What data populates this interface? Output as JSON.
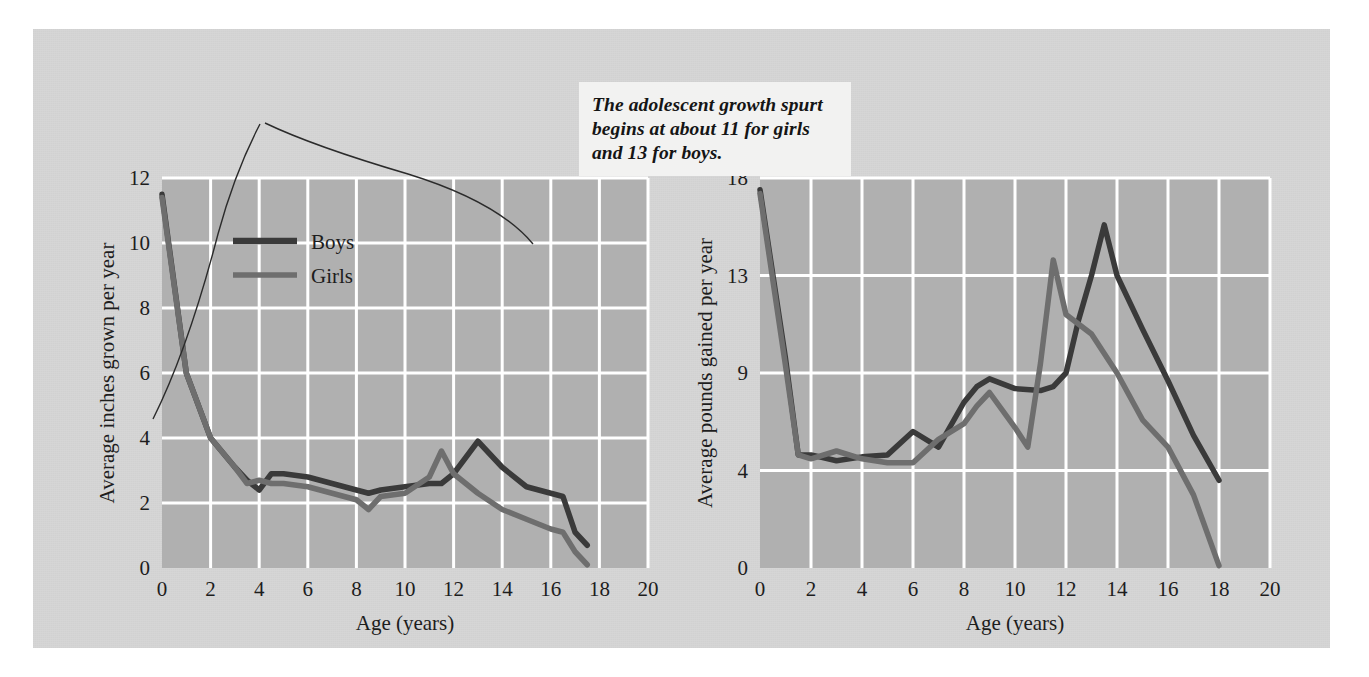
{
  "figure": {
    "background_color": "#d6d6d6",
    "plot_background_color": "#b0b0b0",
    "gridline_color": "#ffffff",
    "boys_color": "#3a3a3a",
    "girls_color": "#6e6e6e"
  },
  "callout": {
    "name": "growth-spurt-callout",
    "lines": [
      "The adolescent growth spurt",
      "begins at about 11 for girls",
      "and 13 for boys."
    ],
    "text": "The adolescent growth spurt begins at about 11 for girls and 13 for boys."
  },
  "legend": {
    "items": [
      {
        "label": "Boys",
        "color": "#3a3a3a"
      },
      {
        "label": "Girls",
        "color": "#6e6e6e"
      }
    ]
  },
  "chart_data": [
    {
      "id": "height-velocity",
      "type": "line",
      "title": "",
      "xlabel": "Age (years)",
      "ylabel": "Average inches grown per year",
      "xlim": [
        0,
        20
      ],
      "ylim": [
        0,
        12
      ],
      "xticks": [
        0,
        2,
        4,
        6,
        8,
        10,
        12,
        14,
        16,
        18,
        20
      ],
      "yticks": [
        0,
        2,
        4,
        6,
        8,
        10,
        12
      ],
      "grid": true,
      "legend_position": "upper-center",
      "series": [
        {
          "name": "Boys",
          "color": "#3a3a3a",
          "x": [
            0,
            1,
            2,
            3,
            3.5,
            4,
            4.5,
            5,
            6,
            7,
            8,
            8.5,
            9,
            10,
            11,
            11.5,
            12,
            13,
            14,
            15,
            16,
            16.5,
            17,
            17.5
          ],
          "y": [
            11.5,
            6.0,
            4.0,
            3.1,
            2.7,
            2.4,
            2.9,
            2.9,
            2.8,
            2.6,
            2.4,
            2.3,
            2.4,
            2.5,
            2.6,
            2.6,
            2.9,
            3.9,
            3.1,
            2.5,
            2.3,
            2.2,
            1.1,
            0.7
          ]
        },
        {
          "name": "Girls",
          "color": "#6e6e6e",
          "x": [
            0,
            1,
            2,
            3,
            3.5,
            4,
            4.5,
            5,
            6,
            7,
            8,
            8.5,
            9,
            10,
            11,
            11.5,
            12,
            13,
            14,
            15,
            16,
            16.5,
            17,
            17.5
          ],
          "y": [
            11.4,
            6.0,
            4.0,
            3.1,
            2.6,
            2.7,
            2.6,
            2.6,
            2.5,
            2.3,
            2.1,
            1.8,
            2.2,
            2.3,
            2.8,
            3.6,
            2.9,
            2.3,
            1.8,
            1.5,
            1.2,
            1.1,
            0.5,
            0.1
          ]
        }
      ]
    },
    {
      "id": "weight-velocity",
      "type": "line",
      "title": "",
      "xlabel": "Age (years)",
      "ylabel": "Average pounds gained per year",
      "xlim": [
        0,
        20
      ],
      "ylim": [
        0,
        18
      ],
      "xticks": [
        0,
        2,
        4,
        6,
        8,
        10,
        12,
        14,
        16,
        18,
        20
      ],
      "yticks": [
        0,
        4,
        9,
        13,
        18
      ],
      "grid": true,
      "legend_position": "none",
      "series": [
        {
          "name": "Boys",
          "color": "#3a3a3a",
          "x": [
            0,
            1,
            1.5,
            2,
            3,
            4,
            5,
            6,
            7,
            8,
            8.5,
            9,
            10,
            11,
            11.5,
            12,
            12.5,
            13,
            13.5,
            14,
            15,
            16,
            17,
            18
          ],
          "y": [
            17.4,
            9.6,
            4.8,
            4.8,
            4.5,
            4.7,
            4.8,
            6.0,
            5.2,
            7.5,
            8.3,
            8.7,
            8.2,
            8.1,
            8.3,
            9.0,
            11.2,
            13.0,
            15.6,
            13.0,
            10.8,
            8.6,
            5.8,
            3.6
          ]
        },
        {
          "name": "Girls",
          "color": "#6e6e6e",
          "x": [
            0,
            1,
            1.5,
            2,
            3,
            4,
            5,
            6,
            7,
            8,
            8.5,
            9,
            10,
            10.5,
            11,
            11.5,
            12,
            13,
            14,
            15,
            16,
            17,
            18
          ],
          "y": [
            17.2,
            9.3,
            4.8,
            4.6,
            5.0,
            4.6,
            4.4,
            4.4,
            5.6,
            6.4,
            7.3,
            8.0,
            6.2,
            5.2,
            9.4,
            13.8,
            11.4,
            10.6,
            9.0,
            6.6,
            5.2,
            3.0,
            0.1
          ]
        }
      ]
    }
  ]
}
